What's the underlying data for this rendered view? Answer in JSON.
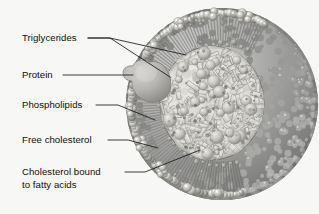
{
  "figure": {
    "background_color": "#f7f7f6",
    "ink_color": "#1b1b1b",
    "style": "grayscale airbrush scientific illustration"
  },
  "labels": [
    {
      "id": "triglycerides",
      "text": "Triglycerides",
      "text2": "",
      "x": 22,
      "y": 41,
      "leaders": [
        {
          "points": "88,38 110,38 170,77"
        },
        {
          "points": "88,38 110,38 186,55"
        }
      ]
    },
    {
      "id": "protein",
      "text": "Protein",
      "text2": "",
      "x": 22,
      "y": 78,
      "leaders": [
        {
          "points": "63,75 133,75"
        }
      ]
    },
    {
      "id": "phospholipids",
      "text": "Phospholipids",
      "text2": "",
      "x": 22,
      "y": 108,
      "leaders": [
        {
          "points": "96,105 118,105 155,120"
        }
      ]
    },
    {
      "id": "free-cholesterol",
      "text": "Free cholesterol",
      "text2": "",
      "x": 22,
      "y": 143,
      "leaders": [
        {
          "points": "108,140 128,140 158,148"
        }
      ]
    },
    {
      "id": "cholesterol-bound-to-fatty-acids",
      "text": "Cholesterol bound",
      "text2": "to fatty acids",
      "x": 22,
      "y": 175,
      "leaders": [
        {
          "points": "125,172 145,172 200,150"
        }
      ]
    }
  ],
  "structures": {
    "particle": {
      "name": "lipoprotein-particle",
      "center_x": 222,
      "center_y": 104,
      "radius": 96
    },
    "core": {
      "name": "lipid-core",
      "center_x": 212,
      "center_y": 103,
      "radius_x": 52,
      "radius_y": 57,
      "description": "crystalline triglyceride and cholesterol ester rods"
    },
    "protein": {
      "name": "apolipoprotein",
      "description": "smooth lobed globular protein on left surface"
    },
    "monolayer": {
      "name": "phospholipid-monolayer",
      "description": "spherical head groups with linear hydrocarbon tails"
    }
  }
}
